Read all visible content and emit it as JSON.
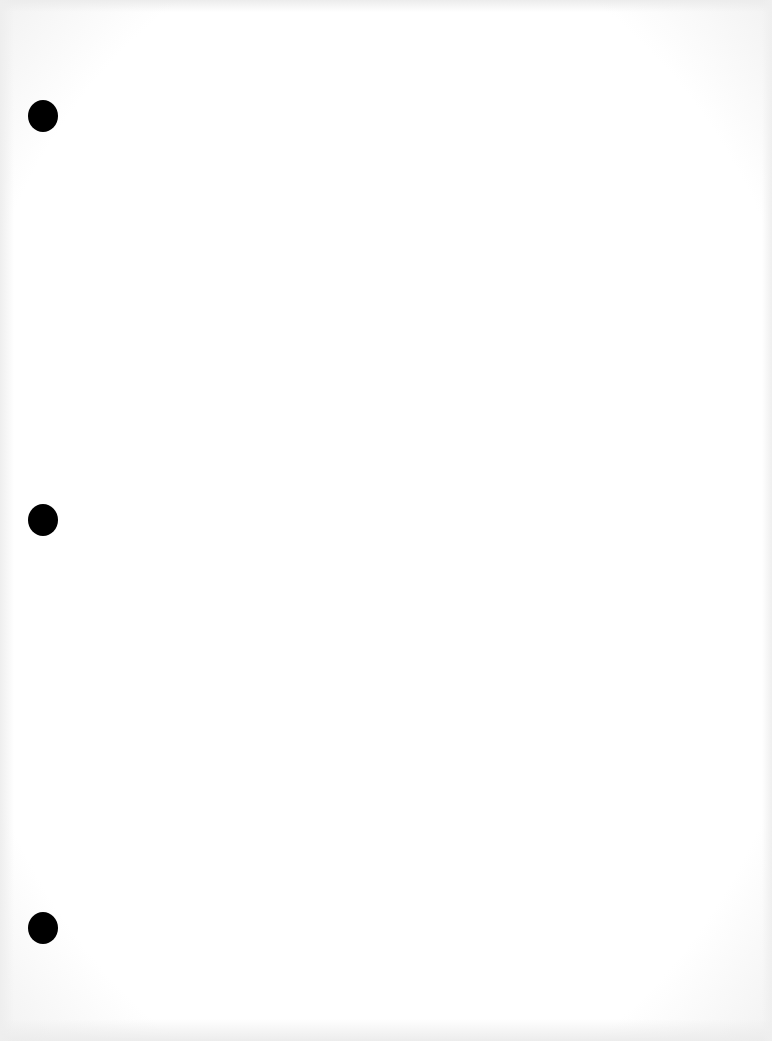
{
  "document": {
    "type": "blank scanned page",
    "text": "",
    "punch_holes": [
      {
        "id": "top"
      },
      {
        "id": "middle"
      },
      {
        "id": "bottom"
      }
    ],
    "colors": {
      "paper": "#ffffff",
      "edge_shadow": "#ececec",
      "hole": "#000000"
    }
  }
}
